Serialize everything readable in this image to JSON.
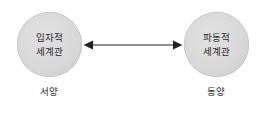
{
  "diagram": {
    "type": "two-node-bidirectional",
    "background_color": "#ffffff",
    "nodes": [
      {
        "id": "particle-worldview",
        "side": "left",
        "lines": [
          "입자적",
          "세계관"
        ],
        "caption": "서양",
        "fill_color": "#d9d9d9",
        "edge_color": "#bcbcbc",
        "text_color": "#2b2b2b"
      },
      {
        "id": "wave-worldview",
        "side": "right",
        "lines": [
          "파동적",
          "세계관"
        ],
        "caption": "동양",
        "fill_color": "#d9d9d9",
        "edge_color": "#bcbcbc",
        "text_color": "#2b2b2b"
      }
    ],
    "connector": {
      "name": "double-headed-arrow",
      "direction": "bidirectional",
      "color": "#222222"
    }
  }
}
